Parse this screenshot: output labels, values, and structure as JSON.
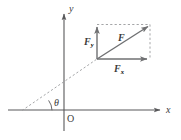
{
  "figure": {
    "colors": {
      "axis": "#58585a",
      "vector": "#6f7072",
      "dashed": "#9a9b9d",
      "text": "#3b3b3b",
      "background": "#ffffff"
    },
    "axes": {
      "x_label": "x",
      "y_label": "y",
      "origin_label": "O"
    },
    "angle": {
      "label": "θ"
    },
    "vectors": [
      {
        "name": "resultant",
        "label_base": "F",
        "label_sub": "",
        "style": "solid-arrow"
      },
      {
        "name": "y-component",
        "label_base": "F",
        "label_sub": "y",
        "style": "solid-arrow"
      },
      {
        "name": "x-component",
        "label_base": "F",
        "label_sub": "x",
        "style": "solid-arrow"
      }
    ],
    "construction": {
      "line_of_action": "dashed",
      "parallelogram": "dashed"
    }
  }
}
